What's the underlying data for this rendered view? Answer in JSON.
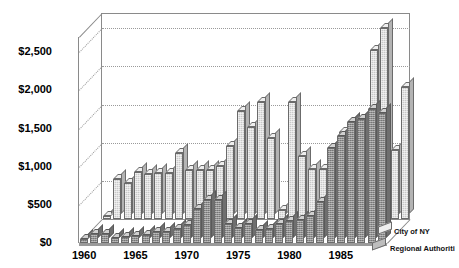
{
  "chart_data": {
    "type": "bar",
    "title": "",
    "subtitle": "",
    "xlabel": "",
    "ylabel": "",
    "ylim": [
      0,
      2700
    ],
    "yticks": [
      0,
      500,
      1000,
      1500,
      2000,
      2500
    ],
    "ytick_labels": [
      "$0",
      "$500",
      "$1,000",
      "$1,500",
      "$2,000",
      "$2,500"
    ],
    "grid": true,
    "legend_position": "right",
    "three_d": true,
    "categories": [
      1960,
      1961,
      1962,
      1963,
      1964,
      1965,
      1966,
      1967,
      1968,
      1969,
      1970,
      1971,
      1972,
      1973,
      1974,
      1975,
      1976,
      1977,
      1978,
      1979,
      1980,
      1981,
      1982,
      1983,
      1984,
      1985,
      1986,
      1987,
      1988,
      1989
    ],
    "xtick_labels": [
      "1960",
      "1965",
      "1970",
      "1975",
      "1980",
      "1985"
    ],
    "xtick_categories": [
      1960,
      1965,
      1970,
      1975,
      1980,
      1985
    ],
    "series": [
      {
        "name": "City of NY",
        "color": "#c9c9c9",
        "values": [
          40,
          520,
          470,
          610,
          590,
          600,
          600,
          870,
          640,
          640,
          640,
          690,
          960,
          1420,
          1200,
          1540,
          1060,
          120,
          1540,
          820,
          650,
          660,
          270,
          1140,
          1060,
          1290,
          2220,
          2500,
          900,
          1730
        ]
      },
      {
        "name": "Regional Authoriti",
        "color": "#8f8f8f",
        "values": [
          55,
          120,
          120,
          60,
          80,
          90,
          110,
          140,
          140,
          180,
          240,
          440,
          560,
          560,
          250,
          200,
          250,
          170,
          190,
          250,
          290,
          300,
          360,
          540,
          1250,
          1400,
          1580,
          1620,
          1750,
          1700
        ]
      }
    ]
  },
  "legend": {
    "entries": [
      {
        "label": "City of NY"
      },
      {
        "label": "Regional Authoriti"
      }
    ]
  },
  "axis": {
    "y_labels": [
      "$2,500",
      "$2,000",
      "$1,500",
      "$1,000",
      "$500",
      "$0"
    ],
    "x_labels": [
      "1960",
      "1965",
      "1970",
      "1975",
      "1980",
      "1985"
    ]
  }
}
